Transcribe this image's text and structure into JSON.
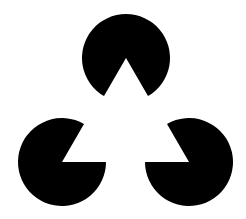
{
  "figure": {
    "name": "kanizsa-triangle",
    "background": "#ffffff",
    "fill": "#000000",
    "radius": 44,
    "notch_angle_deg": 60,
    "inducers": [
      {
        "id": "top",
        "cx": 126,
        "cy": 58,
        "notch_dir_deg": 90
      },
      {
        "id": "bottom-left",
        "cx": 62,
        "cy": 162,
        "notch_dir_deg": -30
      },
      {
        "id": "bottom-right",
        "cx": 189,
        "cy": 162,
        "notch_dir_deg": 210
      }
    ]
  }
}
